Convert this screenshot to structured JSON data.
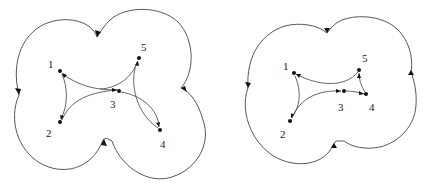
{
  "diagrams": [
    {
      "id": "left",
      "nodes": [
        {
          "label": "1",
          "x": 60,
          "y": 71,
          "lx": 48,
          "ly": 68
        },
        {
          "label": "2",
          "x": 60,
          "y": 122,
          "lx": 46,
          "ly": 137
        },
        {
          "label": "3",
          "x": 119,
          "y": 91,
          "lx": 110,
          "ly": 108
        },
        {
          "label": "4",
          "x": 160,
          "y": 130,
          "lx": 160,
          "ly": 148
        },
        {
          "label": "5",
          "x": 139,
          "y": 58,
          "lx": 141,
          "ly": 51
        }
      ]
    },
    {
      "id": "right",
      "nodes": [
        {
          "label": "1",
          "x": 294,
          "y": 73,
          "lx": 283,
          "ly": 70
        },
        {
          "label": "2",
          "x": 290,
          "y": 121,
          "lx": 280,
          "ly": 138
        },
        {
          "label": "3",
          "x": 344,
          "y": 91,
          "lx": 338,
          "ly": 111
        },
        {
          "label": "4",
          "x": 366,
          "y": 94,
          "lx": 369,
          "ly": 111
        },
        {
          "label": "5",
          "x": 359,
          "y": 70,
          "lx": 362,
          "ly": 62
        }
      ]
    }
  ],
  "colors": {
    "stroke": "#555555",
    "node": "#111111",
    "background": "#ffffff"
  }
}
